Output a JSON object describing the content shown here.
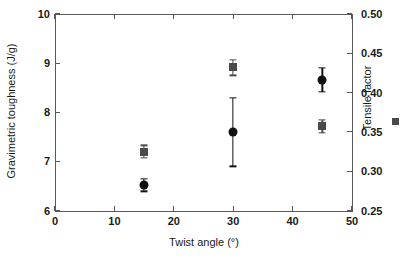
{
  "chart_data": {
    "type": "scatter",
    "title": "",
    "xlabel": "Twist angle (°)",
    "ylabel": "Gravimetric toughness (J/g)",
    "y2label": "Tensile factor",
    "xlim": [
      0,
      50
    ],
    "ylim": [
      6,
      10
    ],
    "y2lim": [
      0.25,
      0.5
    ],
    "xticks": [
      "0",
      "10",
      "20",
      "30",
      "40",
      "50"
    ],
    "xtick_values": [
      0,
      10,
      20,
      30,
      40,
      50
    ],
    "yticks": [
      "6",
      "7",
      "8",
      "9",
      "10"
    ],
    "ytick_values": [
      6,
      7,
      8,
      9,
      10
    ],
    "y2ticks": [
      "0.25",
      "0.30",
      "0.35",
      "0.40",
      "0.45",
      "0.50"
    ],
    "y2tick_values": [
      0.25,
      0.3,
      0.35,
      0.4,
      0.45,
      0.5
    ],
    "grid": false,
    "legend_position": "right-outside",
    "x": [
      15,
      30,
      45
    ],
    "series": [
      {
        "name": "Gravimetric toughness",
        "axis": "left",
        "marker": "circle",
        "color": "#111111",
        "values": [
          6.52,
          7.6,
          8.66
        ],
        "errors": [
          0.13,
          0.7,
          0.25
        ]
      },
      {
        "name": "Tensile factor",
        "axis": "right",
        "marker": "square",
        "color": "#4a4a4a",
        "values": [
          0.325,
          0.432,
          0.357
        ],
        "errors": [
          0.008,
          0.01,
          0.008
        ]
      }
    ],
    "legend": [
      {
        "label": "Tensile factor",
        "marker": "square",
        "color": "#4a4a4a"
      }
    ]
  },
  "axes": {
    "x_title": "Twist angle (°)",
    "y_left_title": "Gravimetric toughness (J/g)",
    "y_right_title": "Tensile factor"
  },
  "colors": {
    "axis": "#595959",
    "circle": "#111111",
    "square": "#4a4a4a",
    "background": "#ffffff"
  }
}
